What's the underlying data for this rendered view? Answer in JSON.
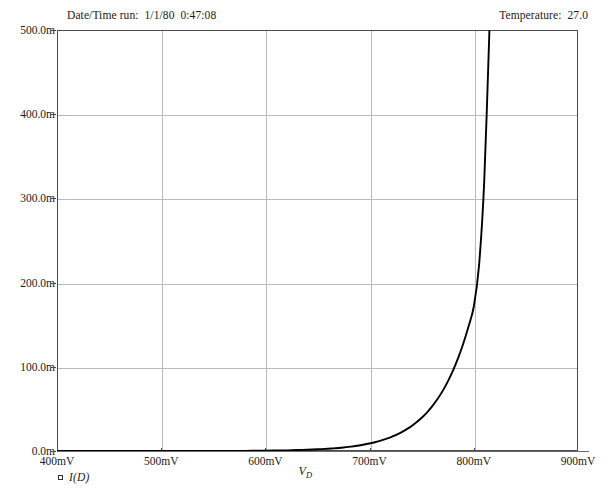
{
  "header": {
    "datetime_label": "Date/Time run:  1/1/80  0:47:08",
    "temperature_label": "Temperature:  27.0"
  },
  "legend": {
    "marker_icon": "square-marker-icon",
    "label": "I(D)"
  },
  "axis": {
    "x_title": "V",
    "x_title_sub": "D"
  },
  "chart_data": {
    "type": "line",
    "title": "",
    "subtitle": "",
    "xlabel": "VD",
    "ylabel": "",
    "xlim": [
      400,
      900
    ],
    "ylim": [
      0,
      0.5
    ],
    "grid": true,
    "legend_position": "bottom-left",
    "x_unit": "mV",
    "y_unit": "A",
    "xticks": [
      400,
      500,
      600,
      700,
      800,
      900
    ],
    "xtick_labels": [
      "400mV",
      "500mV",
      "600mV",
      "700mV",
      "800mV",
      "900mV"
    ],
    "yticks": [
      0.0,
      0.1,
      0.2,
      0.3,
      0.4,
      0.5
    ],
    "ytick_labels": [
      "0.0m",
      "100.0m",
      "200.0m",
      "300.0m",
      "400.0m",
      "500.0m"
    ],
    "series": [
      {
        "name": "I(D)",
        "color": "#000000",
        "x": [
          400,
          420,
          440,
          460,
          480,
          500,
          520,
          540,
          560,
          580,
          600,
          610,
          620,
          630,
          640,
          650,
          660,
          665,
          670,
          675,
          680,
          685,
          690,
          695,
          700,
          705,
          710,
          715,
          720,
          725,
          730,
          735,
          740,
          745,
          750,
          755,
          760,
          765,
          770,
          775,
          780,
          785,
          790,
          795,
          800,
          805,
          810,
          815
        ],
        "y": [
          0.0,
          0.0,
          0.0,
          0.0,
          0.0,
          0.0,
          0.0,
          0.0001,
          0.0001,
          0.0002,
          0.0004,
          0.0006,
          0.0008,
          0.0011,
          0.0015,
          0.002,
          0.0027,
          0.0031,
          0.0036,
          0.0042,
          0.0049,
          0.0057,
          0.0066,
          0.0077,
          0.009,
          0.0104,
          0.0121,
          0.014,
          0.0163,
          0.0189,
          0.0219,
          0.0254,
          0.0294,
          0.0341,
          0.0395,
          0.0457,
          0.053,
          0.0614,
          0.0711,
          0.0824,
          0.0954,
          0.1105,
          0.128,
          0.1482,
          0.1716,
          0.22,
          0.32,
          0.5
        ],
        "annotations": [
          {
            "text": "crosses 100mA near 770mV",
            "x": 770,
            "y": 0.1
          },
          {
            "text": "exits top of plot near 815mV",
            "x": 815,
            "y": 0.5
          }
        ]
      }
    ]
  }
}
